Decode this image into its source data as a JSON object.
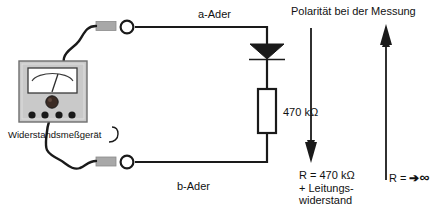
{
  "diagram": {
    "background": "#ffffff",
    "line_color": "#1a1a1a",
    "device_body_color": "#c9c9c9",
    "device_face_color": "#ffffff",
    "connector_color": "#a8a8a8"
  },
  "labels": {
    "a_ader": "a-Ader",
    "b_ader": "b-Ader",
    "resistor_value": "470 kΩ",
    "meter_name": "Widerstandsmeßgerät",
    "polarity_heading": "Polarität bei der Messung",
    "result_left_line1": "R = 470 kΩ",
    "result_left_line2": "+ Leitungs-",
    "result_left_line3": "widerstand",
    "result_right_prefix": "R = ",
    "result_right_arrow": "➔",
    "result_right_infinity": "∞"
  },
  "components": {
    "meter": {
      "name": "analog-ohmmeter",
      "terminals": 4,
      "needle_visible": true,
      "knob_visible": true
    },
    "diode": {
      "name": "diode",
      "orientation": "cathode-down",
      "filled": true
    },
    "resistor": {
      "name": "resistor",
      "value": "470 kΩ",
      "style": "iec-rectangle"
    },
    "terminal_a": {
      "name": "terminal-a",
      "shape": "circle"
    },
    "terminal_b": {
      "name": "terminal-b",
      "shape": "circle"
    },
    "connector_a": {
      "name": "connector-plug-a",
      "shape": "rectangle"
    },
    "connector_b": {
      "name": "connector-plug-b",
      "shape": "rectangle"
    }
  },
  "arrows": {
    "left": {
      "name": "polarity-arrow-down",
      "direction": "down"
    },
    "right": {
      "name": "polarity-arrow-up",
      "direction": "up"
    }
  }
}
